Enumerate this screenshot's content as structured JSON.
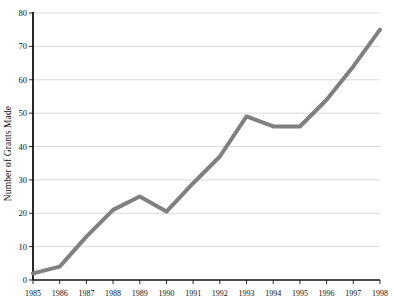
{
  "chart_data": {
    "type": "line",
    "title": "",
    "subtitle": "",
    "xlabel": "",
    "ylabel": "Number of Grants Made",
    "x": [
      1985,
      1986,
      1987,
      1988,
      1989,
      1990,
      1991,
      1992,
      1993,
      1994,
      1995,
      1996,
      1997,
      1998
    ],
    "categories": [
      "1985",
      "1986",
      "1987",
      "1988",
      "1989",
      "1990",
      "1991",
      "1992",
      "1993",
      "1994",
      "1995",
      "1996",
      "1997",
      "1998"
    ],
    "values": [
      2,
      4,
      13,
      21,
      25,
      20.5,
      29,
      37,
      49,
      46,
      46,
      54,
      64,
      75
    ],
    "series": [
      {
        "name": "Number of Grants Made",
        "values": [
          2,
          4,
          13,
          21,
          25,
          20.5,
          29,
          37,
          49,
          46,
          46,
          54,
          64,
          75
        ],
        "color": "#808080",
        "line_width": 4
      }
    ],
    "ylim": [
      0,
      80
    ],
    "ytick_labels": [
      "0",
      "10",
      "20",
      "30",
      "40",
      "50",
      "60",
      "70",
      "80"
    ],
    "yticks": [
      0,
      10,
      20,
      30,
      40,
      50,
      60,
      70,
      80
    ],
    "xlim": [
      1985,
      1998
    ],
    "xtick_labels": [
      "1985",
      "1986",
      "1987",
      "1988",
      "1989",
      "1990",
      "1991",
      "1992",
      "1993",
      "1994",
      "1995",
      "1996",
      "1997",
      "1998"
    ],
    "grid": "horizontal",
    "grid_color": "#d8d8d8",
    "axis_color": "#111111",
    "background_color": "#ffffff",
    "legend": "none",
    "legend_position": "none",
    "annotations": []
  },
  "layout": {
    "plot_left": 33,
    "plot_right": 380,
    "plot_top": 13,
    "plot_bottom": 280,
    "x_label_y": 289
  }
}
